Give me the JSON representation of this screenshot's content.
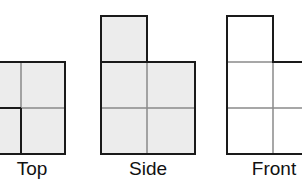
{
  "views": [
    {
      "name": "top",
      "label": "Top"
    },
    {
      "name": "side",
      "label": "Side"
    },
    {
      "name": "front",
      "label": "Front"
    }
  ],
  "colors": {
    "shaded_fill": "#ececec",
    "unshaded_fill": "#ffffff",
    "outline": "#1a1a1a",
    "grid_line": "#8a8a8a"
  }
}
